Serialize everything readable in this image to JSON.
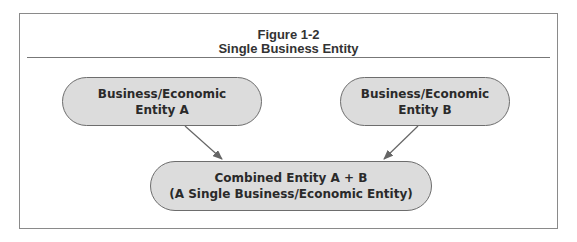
{
  "figure": {
    "number": "Figure 1-2",
    "title": "Single Business Entity"
  },
  "nodes": {
    "entity_a": {
      "line1": "Business/Economic",
      "line2": "Entity A"
    },
    "entity_b": {
      "line1": "Business/Economic",
      "line2": "Entity B"
    },
    "combined": {
      "line1": "Combined Entity A + B",
      "line2": "(A Single Business/Economic Entity)"
    }
  },
  "edges": [
    {
      "from": "entity_a",
      "to": "combined"
    },
    {
      "from": "entity_b",
      "to": "combined"
    }
  ],
  "colors": {
    "node_fill": "#dcdcdc",
    "node_border": "#6d6d6d",
    "arrow": "#666666"
  }
}
